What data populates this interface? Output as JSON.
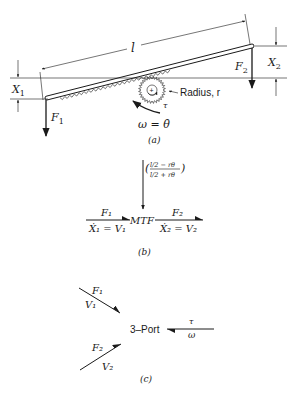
{
  "part_a": {
    "length_label": "l",
    "x1_label": "X",
    "x1_sub": "1",
    "x2_label": "X",
    "x2_sub": "2",
    "f1_label": "F",
    "f1_sub": "1",
    "f2_label": "F",
    "f2_sub": "2",
    "radius_label": "Radius, r",
    "torque_label": "τ",
    "omega_label": "ω = θ̇",
    "gear_sign": "+",
    "caption": "(a)"
  },
  "part_b": {
    "modulus_numerator": "l/2 − rθ",
    "modulus_denominator": "l/2 + rθ",
    "element_label": "MTF",
    "left_effort": "F₁",
    "left_flow": "Ẋ₁ = V₁",
    "right_effort": "F₂",
    "right_flow": "Ẋ₂ = V₂",
    "caption": "(b)"
  },
  "part_c": {
    "element_label": "3–Port",
    "bond1_effort": "F₁",
    "bond1_flow": "V₁",
    "bond2_effort": "F₂",
    "bond2_flow": "V₂",
    "bond3_effort": "τ",
    "bond3_flow": "ω",
    "caption": "(c)"
  }
}
